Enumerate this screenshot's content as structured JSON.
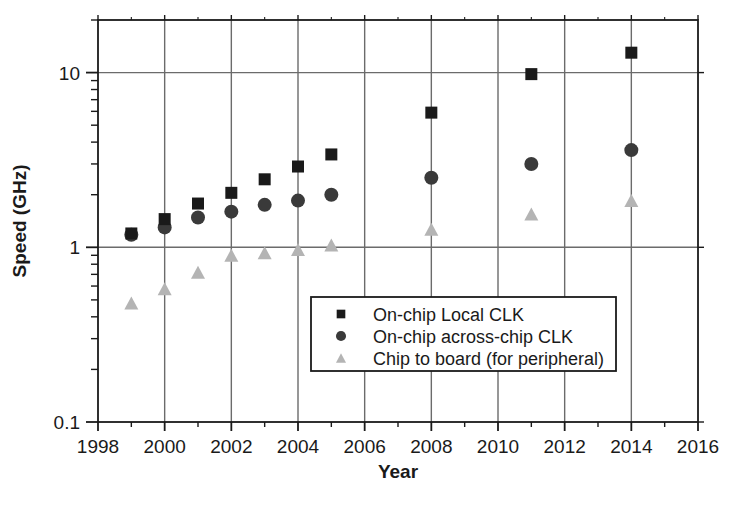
{
  "chart_data": {
    "type": "scatter",
    "title": "",
    "xlabel": "Year",
    "ylabel": "Speed (GHz)",
    "xlim": [
      1998,
      2016
    ],
    "ylim": [
      0.1,
      20
    ],
    "yscale": "log",
    "grid": true,
    "legend_position": "center-right",
    "x_ticks": [
      "1998",
      "2000",
      "2002",
      "2004",
      "2006",
      "2008",
      "2010",
      "2012",
      "2014",
      "2016"
    ],
    "x_tick_values": [
      1998,
      2000,
      2002,
      2004,
      2006,
      2008,
      2010,
      2012,
      2014,
      2016
    ],
    "y_ticks": [
      "10",
      "1",
      "0.1"
    ],
    "y_tick_values": [
      10,
      1,
      0.1
    ],
    "series": [
      {
        "name": "On-chip Local CLK",
        "marker": "square",
        "color": "#1a1a1a",
        "points": [
          {
            "x": 1999,
            "y": 1.2
          },
          {
            "x": 2000,
            "y": 1.45
          },
          {
            "x": 2001,
            "y": 1.78
          },
          {
            "x": 2002,
            "y": 2.05
          },
          {
            "x": 2003,
            "y": 2.45
          },
          {
            "x": 2004,
            "y": 2.9
          },
          {
            "x": 2005,
            "y": 3.4
          },
          {
            "x": 2008,
            "y": 5.9
          },
          {
            "x": 2011,
            "y": 9.8
          },
          {
            "x": 2014,
            "y": 13.0
          }
        ]
      },
      {
        "name": "On-chip across-chip CLK",
        "marker": "circle",
        "color": "#3a3a3a",
        "points": [
          {
            "x": 1999,
            "y": 1.18
          },
          {
            "x": 2000,
            "y": 1.3
          },
          {
            "x": 2001,
            "y": 1.48
          },
          {
            "x": 2002,
            "y": 1.6
          },
          {
            "x": 2003,
            "y": 1.75
          },
          {
            "x": 2004,
            "y": 1.85
          },
          {
            "x": 2005,
            "y": 2.0
          },
          {
            "x": 2008,
            "y": 2.5
          },
          {
            "x": 2011,
            "y": 3.0
          },
          {
            "x": 2014,
            "y": 3.6
          }
        ]
      },
      {
        "name": "Chip to board (for peripheral)",
        "marker": "triangle",
        "color": "#b4b4b4",
        "points": [
          {
            "x": 1999,
            "y": 0.48
          },
          {
            "x": 2000,
            "y": 0.58
          },
          {
            "x": 2001,
            "y": 0.72
          },
          {
            "x": 2002,
            "y": 0.9
          },
          {
            "x": 2003,
            "y": 0.93
          },
          {
            "x": 2004,
            "y": 0.97
          },
          {
            "x": 2005,
            "y": 1.03
          },
          {
            "x": 2008,
            "y": 1.27
          },
          {
            "x": 2011,
            "y": 1.55
          },
          {
            "x": 2014,
            "y": 1.85
          }
        ]
      }
    ]
  },
  "legend": {
    "items": [
      {
        "label": "On-chip Local CLK",
        "marker": "square",
        "color": "#1a1a1a"
      },
      {
        "label": "On-chip across-chip CLK",
        "marker": "circle",
        "color": "#3a3a3a"
      },
      {
        "label": "Chip to board (for peripheral)",
        "marker": "triangle",
        "color": "#b4b4b4"
      }
    ]
  },
  "colors": {
    "axis": "#1a1a1a",
    "grid": "#6b6b6b",
    "background": "#ffffff",
    "series_square": "#1a1a1a",
    "series_circle": "#3a3a3a",
    "series_triangle": "#b4b4b4"
  }
}
